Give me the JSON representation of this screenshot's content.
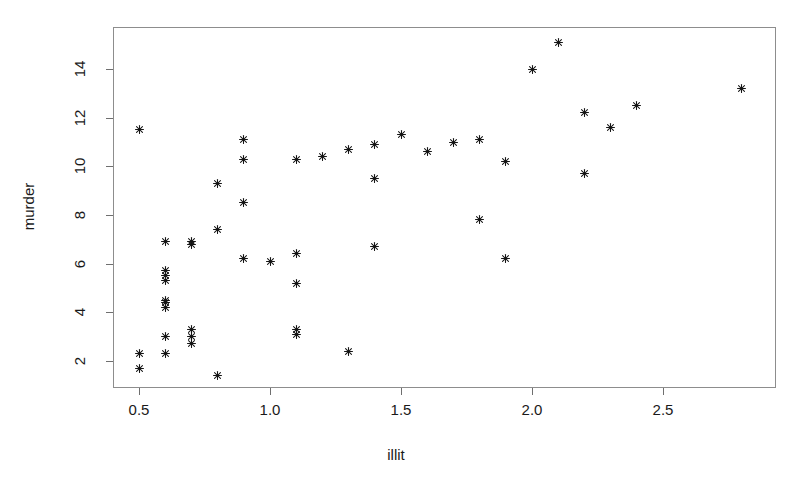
{
  "chart_data": {
    "type": "scatter",
    "title": "",
    "xlabel": "illit",
    "ylabel": "murder",
    "xlim": [
      0.42,
      2.95
    ],
    "ylim": [
      0.9,
      15.5
    ],
    "xticks": [
      0.5,
      1.0,
      1.5,
      2.0,
      2.5
    ],
    "xticklabels": [
      "0.5",
      "1.0",
      "1.5",
      "2.0",
      "2.5"
    ],
    "yticks": [
      2,
      4,
      6,
      8,
      10,
      12,
      14
    ],
    "yticklabels": [
      "2",
      "4",
      "6",
      "8",
      "10",
      "12",
      "14"
    ],
    "grid": false,
    "legend": null,
    "marker": "star",
    "marker_color": "#141414",
    "frame_color": "#8d8d8d",
    "background": "#ffffff",
    "n_points": 50,
    "points": [
      {
        "x": 0.5,
        "y": 11.5
      },
      {
        "x": 0.5,
        "y": 2.3
      },
      {
        "x": 0.5,
        "y": 1.7
      },
      {
        "x": 0.6,
        "y": 6.9
      },
      {
        "x": 0.6,
        "y": 5.7
      },
      {
        "x": 0.6,
        "y": 5.5
      },
      {
        "x": 0.6,
        "y": 5.3
      },
      {
        "x": 0.6,
        "y": 4.5
      },
      {
        "x": 0.6,
        "y": 4.4
      },
      {
        "x": 0.6,
        "y": 4.2
      },
      {
        "x": 0.6,
        "y": 3.0
      },
      {
        "x": 0.6,
        "y": 2.3
      },
      {
        "x": 0.7,
        "y": 6.9
      },
      {
        "x": 0.7,
        "y": 6.8
      },
      {
        "x": 0.7,
        "y": 3.3
      },
      {
        "x": 0.7,
        "y": 3.0
      },
      {
        "x": 0.7,
        "y": 2.7
      },
      {
        "x": 0.8,
        "y": 9.3
      },
      {
        "x": 0.8,
        "y": 7.4
      },
      {
        "x": 0.8,
        "y": 1.4
      },
      {
        "x": 0.9,
        "y": 11.1
      },
      {
        "x": 0.9,
        "y": 10.3
      },
      {
        "x": 0.9,
        "y": 8.5
      },
      {
        "x": 0.9,
        "y": 6.2
      },
      {
        "x": 1.0,
        "y": 6.1
      },
      {
        "x": 1.1,
        "y": 10.3
      },
      {
        "x": 1.1,
        "y": 6.4
      },
      {
        "x": 1.1,
        "y": 5.2
      },
      {
        "x": 1.1,
        "y": 3.3
      },
      {
        "x": 1.1,
        "y": 3.1
      },
      {
        "x": 1.3,
        "y": 10.7
      },
      {
        "x": 1.3,
        "y": 2.4
      },
      {
        "x": 1.4,
        "y": 10.9
      },
      {
        "x": 1.4,
        "y": 9.5
      },
      {
        "x": 1.4,
        "y": 6.7
      },
      {
        "x": 1.5,
        "y": 11.3
      },
      {
        "x": 1.6,
        "y": 10.6
      },
      {
        "x": 1.7,
        "y": 11.0
      },
      {
        "x": 1.8,
        "y": 11.1
      },
      {
        "x": 1.8,
        "y": 7.8
      },
      {
        "x": 1.9,
        "y": 10.2
      },
      {
        "x": 1.9,
        "y": 6.2
      },
      {
        "x": 2.0,
        "y": 14.0
      },
      {
        "x": 2.1,
        "y": 15.1
      },
      {
        "x": 2.2,
        "y": 12.2
      },
      {
        "x": 2.2,
        "y": 9.7
      },
      {
        "x": 2.3,
        "y": 11.6
      },
      {
        "x": 2.4,
        "y": 12.5
      },
      {
        "x": 2.8,
        "y": 13.2
      },
      {
        "x": 1.2,
        "y": 10.4
      }
    ]
  },
  "axes": {
    "x_title": "illit",
    "y_title": "murder"
  }
}
